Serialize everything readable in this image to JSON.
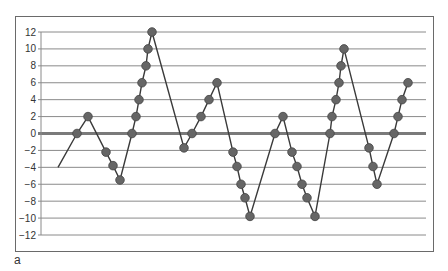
{
  "panel_label": "a",
  "colors": {
    "gridline": "#8a8a8a",
    "zero_line": "#7a7a7a",
    "series_line": "#3a3a3a",
    "marker": "#666666",
    "marker_stroke": "#444444",
    "frame": "#6a6a6a"
  },
  "chart_data": {
    "type": "line",
    "title": "",
    "xlabel": "",
    "ylabel": "",
    "ylim": [
      -12,
      12
    ],
    "y_ticks": [
      12,
      10,
      8,
      6,
      4,
      2,
      0,
      -2,
      -4,
      -6,
      -8,
      -10,
      -12
    ],
    "grid": true,
    "legend": null,
    "annotations": [
      "a"
    ],
    "series": [
      {
        "name": "series-1",
        "x_px": [
          58,
          77,
          88,
          106,
          113,
          120,
          132,
          136,
          139,
          142,
          146,
          148,
          152,
          184,
          192,
          201,
          209,
          217,
          233,
          237,
          241,
          245,
          250,
          275,
          283,
          292,
          297,
          302,
          307,
          315,
          330,
          332,
          336,
          339,
          341,
          344,
          369,
          373,
          377,
          394,
          398,
          402,
          408
        ],
        "values": [
          -4,
          0,
          2,
          -2.2,
          -3.8,
          -5.5,
          0,
          2,
          4,
          6,
          8,
          10,
          12,
          -1.7,
          0,
          2,
          4,
          6,
          -2.2,
          -3.9,
          -6,
          -7.6,
          -9.8,
          0,
          2,
          -2.2,
          -3.9,
          -6,
          -7.6,
          -9.8,
          0,
          2,
          4,
          6,
          8,
          10,
          -1.7,
          -3.9,
          -6,
          0,
          2,
          4,
          6
        ],
        "markers": [
          false,
          true,
          true,
          true,
          true,
          true,
          true,
          true,
          true,
          true,
          true,
          true,
          true,
          true,
          true,
          true,
          true,
          true,
          true,
          true,
          true,
          true,
          true,
          true,
          true,
          true,
          true,
          true,
          true,
          true,
          true,
          true,
          true,
          true,
          true,
          true,
          true,
          true,
          true,
          true,
          true,
          true,
          true
        ]
      }
    ]
  }
}
